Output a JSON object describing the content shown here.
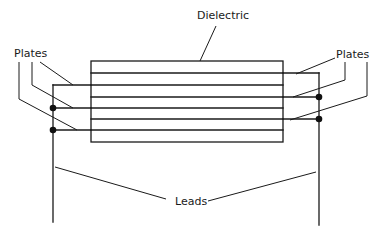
{
  "diagram": {
    "type": "capacitor-construction",
    "labels": {
      "dielectric": "Dielectric",
      "plates_left": "Plates",
      "plates_right": "Plates",
      "leads": "Leads"
    },
    "colors": {
      "line": "#1a1a1a",
      "background": "#ffffff"
    },
    "dielectric_box": {
      "x": 91,
      "y": 61,
      "width": 192,
      "height": 81
    },
    "layer_lines_y": [
      61,
      73,
      85,
      97,
      108,
      119,
      130,
      142
    ],
    "left_plates": {
      "lead_x": 53,
      "plates_y": [
        85,
        108,
        130
      ],
      "plate_end_x": 283,
      "junction_dots_y": [
        108,
        130
      ],
      "lead_bottom_y": 222
    },
    "right_plates": {
      "lead_x": 319,
      "plates_y": [
        73,
        97,
        119
      ],
      "plate_start_x": 91,
      "junction_dots_y": [
        97,
        119
      ],
      "lead_bottom_y": 225
    }
  }
}
